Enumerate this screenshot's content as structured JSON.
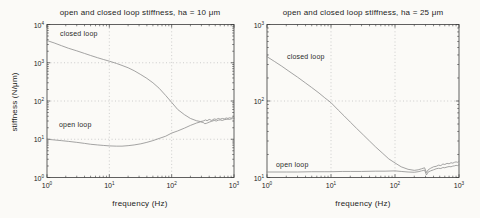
{
  "figure": {
    "background": "#fbfaf7",
    "axis_color": "#3a3a3a",
    "grid_color": "#bdbdbd",
    "curve_color": "#8d8d8d",
    "text_color": "#1c1c1c"
  },
  "chart_data": [
    {
      "type": "line",
      "title": "open and closed loop stiffness, ha = 10 μm",
      "xlabel": "frequency (Hz)",
      "ylabel": "stiffness (N/μm)",
      "xscale": "log",
      "yscale": "log",
      "xlim": [
        1,
        1000
      ],
      "ylim": [
        1,
        10000
      ],
      "x_tick_exponents": [
        0,
        1,
        2,
        3
      ],
      "y_tick_exponents": [
        0,
        1,
        2,
        3,
        4
      ],
      "grid": true,
      "legend_position": "none",
      "annotations": [
        {
          "text": "closed loop"
        },
        {
          "text": "open loop"
        }
      ],
      "series": [
        {
          "name": "closed loop",
          "points": [
            [
              1,
              3800
            ],
            [
              1.3,
              3300
            ],
            [
              1.7,
              2800
            ],
            [
              2.2,
              2400
            ],
            [
              3,
              2050
            ],
            [
              4,
              1750
            ],
            [
              5,
              1550
            ],
            [
              6.5,
              1350
            ],
            [
              8,
              1220
            ],
            [
              10,
              1100
            ],
            [
              13,
              960
            ],
            [
              16,
              850
            ],
            [
              20,
              740
            ],
            [
              25,
              620
            ],
            [
              32,
              490
            ],
            [
              40,
              390
            ],
            [
              50,
              300
            ],
            [
              63,
              215
            ],
            [
              80,
              140
            ],
            [
              100,
              92
            ],
            [
              125,
              60
            ],
            [
              160,
              44
            ],
            [
              200,
              35
            ],
            [
              250,
              30.5
            ],
            [
              290,
              29
            ],
            [
              320,
              30
            ],
            [
              350,
              32
            ],
            [
              370,
              30.5
            ],
            [
              400,
              33
            ],
            [
              440,
              31
            ],
            [
              480,
              34
            ],
            [
              520,
              33
            ],
            [
              560,
              35
            ],
            [
              600,
              33.5
            ],
            [
              650,
              35
            ],
            [
              700,
              34
            ],
            [
              750,
              36
            ],
            [
              800,
              35
            ],
            [
              850,
              36.5
            ],
            [
              900,
              35.5
            ],
            [
              950,
              37
            ],
            [
              1000,
              36
            ]
          ]
        },
        {
          "name": "open loop",
          "points": [
            [
              1,
              10
            ],
            [
              1.3,
              9.6
            ],
            [
              1.7,
              9.2
            ],
            [
              2.2,
              8.8
            ],
            [
              3,
              8.3
            ],
            [
              4,
              7.8
            ],
            [
              5,
              7.4
            ],
            [
              6.5,
              7.1
            ],
            [
              8,
              6.9
            ],
            [
              10,
              6.7
            ],
            [
              13,
              6.6
            ],
            [
              16,
              6.6
            ],
            [
              20,
              6.8
            ],
            [
              25,
              7.1
            ],
            [
              32,
              7.6
            ],
            [
              40,
              8.3
            ],
            [
              50,
              9.2
            ],
            [
              63,
              10.5
            ],
            [
              80,
              12
            ],
            [
              100,
              14.5
            ],
            [
              125,
              16.5
            ],
            [
              160,
              19.5
            ],
            [
              200,
              23
            ],
            [
              250,
              26.5
            ],
            [
              290,
              28.5
            ],
            [
              320,
              27.5
            ],
            [
              340,
              25.5
            ],
            [
              360,
              26
            ],
            [
              380,
              27
            ],
            [
              400,
              28
            ],
            [
              440,
              29.5
            ],
            [
              480,
              31
            ],
            [
              520,
              30
            ],
            [
              560,
              31.5
            ],
            [
              600,
              32
            ],
            [
              650,
              31
            ],
            [
              700,
              32.5
            ],
            [
              750,
              33
            ],
            [
              800,
              33.5
            ],
            [
              850,
              33
            ],
            [
              900,
              34
            ],
            [
              950,
              34.5
            ],
            [
              1000,
              35
            ]
          ]
        }
      ]
    },
    {
      "type": "line",
      "title": "open and closed loop stiffness, ha = 25 μm",
      "xlabel": "frequency (Hz)",
      "ylabel": "",
      "xscale": "log",
      "yscale": "log",
      "xlim": [
        1,
        1000
      ],
      "ylim": [
        10,
        1000
      ],
      "x_tick_exponents": [
        0,
        1,
        2,
        3
      ],
      "y_tick_exponents": [
        1,
        2,
        3
      ],
      "grid": true,
      "legend_position": "none",
      "annotations": [
        {
          "text": "closed loop"
        },
        {
          "text": "open loop"
        }
      ],
      "series": [
        {
          "name": "closed loop",
          "points": [
            [
              1,
              380
            ],
            [
              1.3,
              330
            ],
            [
              1.7,
              285
            ],
            [
              2.2,
              245
            ],
            [
              3,
              205
            ],
            [
              4,
              172
            ],
            [
              5,
              150
            ],
            [
              6.5,
              127
            ],
            [
              8,
              110
            ],
            [
              10,
              95
            ],
            [
              13,
              76
            ],
            [
              16,
              64
            ],
            [
              20,
              53
            ],
            [
              25,
              44
            ],
            [
              32,
              36
            ],
            [
              40,
              30
            ],
            [
              50,
              25
            ],
            [
              63,
              21
            ],
            [
              80,
              17.5
            ],
            [
              100,
              15.5
            ],
            [
              125,
              13.8
            ],
            [
              160,
              12.8
            ],
            [
              200,
              12.4
            ],
            [
              230,
              12.6
            ],
            [
              260,
              13
            ],
            [
              290,
              13.4
            ],
            [
              310,
              11.6
            ],
            [
              330,
              12.6
            ],
            [
              360,
              13.2
            ],
            [
              400,
              13.8
            ],
            [
              440,
              14
            ],
            [
              480,
              14.5
            ],
            [
              520,
              14.3
            ],
            [
              560,
              15
            ],
            [
              600,
              14.8
            ],
            [
              650,
              15.3
            ],
            [
              700,
              15.1
            ],
            [
              750,
              15.6
            ],
            [
              800,
              15.4
            ],
            [
              850,
              15.8
            ],
            [
              900,
              16
            ],
            [
              950,
              15.8
            ],
            [
              1000,
              16.2
            ]
          ]
        },
        {
          "name": "open loop",
          "points": [
            [
              1,
              11.8
            ],
            [
              2,
              11.8
            ],
            [
              3,
              11.8
            ],
            [
              5,
              11.9
            ],
            [
              8,
              11.9
            ],
            [
              10,
              11.9
            ],
            [
              15,
              12
            ],
            [
              20,
              12
            ],
            [
              30,
              12
            ],
            [
              50,
              12.1
            ],
            [
              70,
              12.1
            ],
            [
              100,
              12.2
            ],
            [
              125,
              12
            ],
            [
              160,
              11.8
            ],
            [
              200,
              11.7
            ],
            [
              230,
              11.9
            ],
            [
              260,
              12.2
            ],
            [
              290,
              12.5
            ],
            [
              310,
              10.8
            ],
            [
              330,
              11.8
            ],
            [
              360,
              12.2
            ],
            [
              400,
              12.6
            ],
            [
              440,
              13
            ],
            [
              480,
              13.2
            ],
            [
              520,
              13.1
            ],
            [
              560,
              13.5
            ],
            [
              600,
              13.4
            ],
            [
              650,
              13.7
            ],
            [
              700,
              13.9
            ],
            [
              750,
              13.8
            ],
            [
              800,
              14.1
            ],
            [
              850,
              14.2
            ],
            [
              900,
              14.4
            ],
            [
              950,
              14.3
            ],
            [
              1000,
              14.6
            ]
          ]
        }
      ]
    }
  ]
}
